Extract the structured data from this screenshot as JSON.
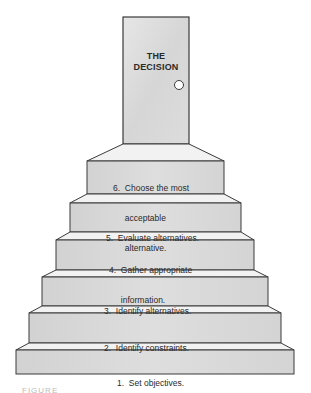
{
  "diagram": {
    "type": "staircase",
    "door": {
      "title_line1": "THE",
      "title_line2": "DECISION",
      "colors": {
        "face": "#dedede",
        "edge": "#3a3a3a",
        "knob": "#ffffff"
      }
    },
    "steps": [
      {
        "number": 1,
        "label": "1.  Set objectives.",
        "lines": [
          "1.  Set objectives."
        ]
      },
      {
        "number": 2,
        "label": "2.  Identify constraints.",
        "lines": [
          "2.  Identify constraints."
        ]
      },
      {
        "number": 3,
        "label": "3.  Identify alternatives.",
        "lines": [
          "3.  Identify alternatives."
        ]
      },
      {
        "number": 4,
        "label": "4.  Gather appropriate information.",
        "lines": [
          "4.  Gather appropriate",
          "     information."
        ]
      },
      {
        "number": 5,
        "label": "5.  Evaluate alternatives.",
        "lines": [
          "5.  Evaluate alternatives."
        ]
      },
      {
        "number": 6,
        "label": "6.  Choose the most acceptable alternative.",
        "lines": [
          "6.  Choose the most",
          "     acceptable",
          "     alternative."
        ]
      }
    ],
    "colors": {
      "riser": "#d9d9d9",
      "tread": "#f0f0f0",
      "edge": "#3a3a3a"
    },
    "caption": "FIGURE"
  }
}
